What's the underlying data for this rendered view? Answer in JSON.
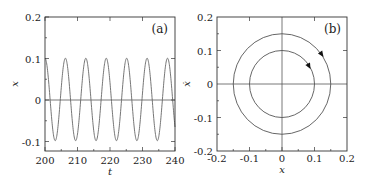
{
  "chart_data": [
    {
      "type": "line",
      "panel": "(a)",
      "xlabel": "t",
      "ylabel": "x",
      "xlim": [
        200,
        240
      ],
      "ylim": [
        -0.125,
        0.2
      ],
      "xticks": [
        "200",
        "210",
        "220",
        "230",
        "240"
      ],
      "yticks": [
        "0.2",
        "0.1",
        "0",
        "-0.1"
      ],
      "grid": false,
      "series": [
        {
          "name": "x(t)",
          "description": "sinusoid x = 0.1 cos(t - 200), period ~2π",
          "amplitude": 0.1,
          "period": 6.283,
          "x": [
            200,
            203.14,
            206.28,
            209.42,
            212.57,
            215.71,
            218.85,
            221.99,
            225.13,
            228.27,
            231.42,
            234.56,
            237.7,
            240
          ],
          "values": [
            0.1,
            -0.1,
            0.1,
            -0.1,
            0.1,
            -0.1,
            0.1,
            -0.1,
            0.1,
            -0.1,
            0.1,
            -0.1,
            0.1,
            -0.067
          ]
        }
      ],
      "reference_lines": [
        {
          "axis": "y",
          "value": 0
        }
      ]
    },
    {
      "type": "line",
      "panel": "(b)",
      "xlabel": "x",
      "ylabel": "ẋ",
      "xlim": [
        -0.2,
        0.2
      ],
      "ylim": [
        -0.2,
        0.2
      ],
      "xticks": [
        "-0.2",
        "-0.1",
        "0",
        "0.1",
        "0.2"
      ],
      "yticks": [
        "0.2",
        "0.1",
        "0",
        "-0.1",
        "-0.2"
      ],
      "grid": false,
      "series": [
        {
          "name": "orbit r=0.1",
          "shape": "circle",
          "center": [
            0,
            0
          ],
          "radius": 0.1,
          "direction": "clockwise"
        },
        {
          "name": "orbit r=0.15",
          "shape": "circle",
          "center": [
            0,
            0
          ],
          "radius": 0.15,
          "direction": "clockwise"
        }
      ],
      "reference_lines": [
        {
          "axis": "x",
          "value": 0
        },
        {
          "axis": "y",
          "value": 0
        }
      ]
    }
  ],
  "panels": {
    "a": {
      "label": "(a)",
      "xlabel": "t",
      "ylabel": "x",
      "xticks": [
        "200",
        "210",
        "220",
        "230",
        "240"
      ],
      "yticks": [
        "0.2",
        "0.1",
        "0",
        "-0.1"
      ]
    },
    "b": {
      "label": "(b)",
      "xlabel": "x",
      "ylabel": "ẋ",
      "xticks": [
        "-0.2",
        "-0.1",
        "0",
        "0.1",
        "0.2"
      ],
      "yticks": [
        "0.2",
        "0.1",
        "0",
        "-0.1",
        "-0.2"
      ]
    }
  },
  "colors": {
    "frame": "#333333",
    "curve": "#555555",
    "text": "#222222"
  }
}
